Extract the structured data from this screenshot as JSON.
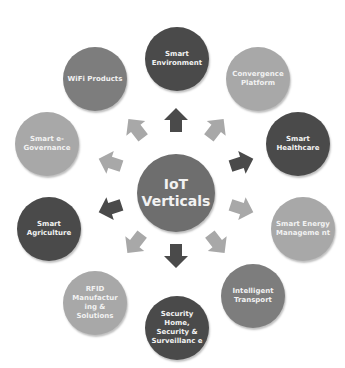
{
  "diagram": {
    "type": "hub-and-spoke",
    "center": {
      "label": "IoT Verticals",
      "line1": "IoT",
      "line2": "Verticals",
      "color": "#6e6e6e"
    },
    "nodes": [
      {
        "id": "smart-environment",
        "label": "Smart Environment",
        "shade": "dark",
        "color": "#4a4a4a"
      },
      {
        "id": "convergence-platform",
        "label": "Convergence Platform",
        "shade": "light",
        "color": "#a8a8a8"
      },
      {
        "id": "smart-healthcare",
        "label": "Smart Healthcare",
        "shade": "dark",
        "color": "#4a4a4a"
      },
      {
        "id": "smart-energy-management",
        "label": "Smart Energy Manageme nt",
        "shade": "light",
        "color": "#a8a8a8"
      },
      {
        "id": "intelligent-transport",
        "label": "Intelligent Transport",
        "shade": "medium",
        "color": "#7d7d7d"
      },
      {
        "id": "security-home",
        "label": "Security Home, Security & Surveillanc e",
        "shade": "dark",
        "color": "#4a4a4a"
      },
      {
        "id": "rfid-manufacturing",
        "label": "RFID Manufactur ing & Solutions",
        "shade": "light",
        "color": "#a8a8a8"
      },
      {
        "id": "smart-agriculture",
        "label": "Smart Agriculture",
        "shade": "dark",
        "color": "#4a4a4a"
      },
      {
        "id": "smart-e-governance",
        "label": "Smart e-Governance",
        "shade": "light",
        "color": "#a8a8a8"
      },
      {
        "id": "wifi-products",
        "label": "WiFi Products",
        "shade": "medium",
        "color": "#7d7d7d"
      }
    ],
    "arrow_colors": {
      "dark": "#4a4a4a",
      "light": "#a8a8a8"
    }
  }
}
